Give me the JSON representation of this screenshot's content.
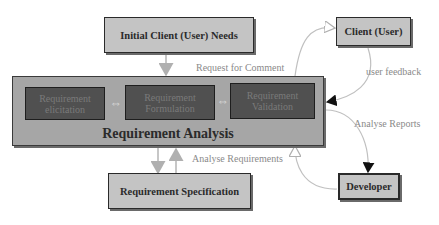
{
  "diagram": {
    "nodes": {
      "initial_needs": "Initial Client (User) Needs",
      "client": "Client (User)",
      "developer": "Developer",
      "req_spec": "Requirement Specification",
      "analysis_group": "Requirement Analysis",
      "elicitation": "Requirement elicitation",
      "formulation": "Requirement Formulation",
      "validation": "Requirement Validation"
    },
    "edges": {
      "request_for_comment": "Request for Comment",
      "user_feedback": "user feedback",
      "analyse_reports": "Analyse Reports",
      "analyse_requirements": "Analyse Requirements"
    },
    "colors": {
      "node_fill": "#c4c4c4",
      "group_fill": "#a6a6a6",
      "inner_fill": "#505050",
      "edge_light": "#b5b5b5",
      "edge_dark": "#111111"
    }
  }
}
